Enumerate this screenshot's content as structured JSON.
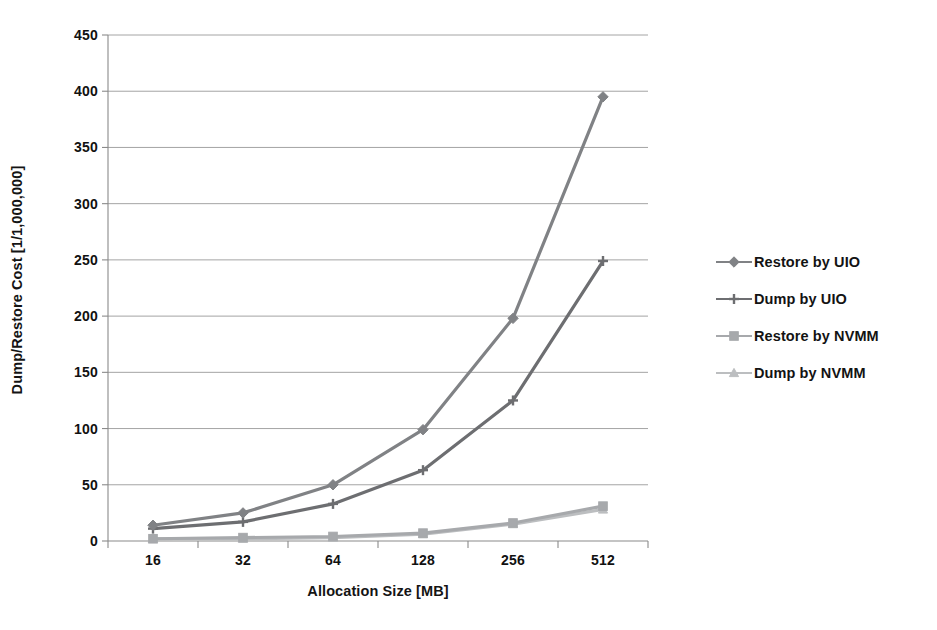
{
  "chart_data": {
    "type": "line",
    "title": "",
    "xlabel": "Allocation Size [MB]",
    "ylabel": "Dump/Restore Cost [1/1,000,000]",
    "categories": [
      "16",
      "32",
      "64",
      "128",
      "256",
      "512"
    ],
    "ylim": [
      0,
      450
    ],
    "ytick_labels": [
      "0",
      "50",
      "100",
      "150",
      "200",
      "250",
      "300",
      "350",
      "400",
      "450"
    ],
    "ytick_values": [
      0,
      50,
      100,
      150,
      200,
      250,
      300,
      350,
      400,
      450
    ],
    "grid": "horizontal",
    "legend_position": "right",
    "series": [
      {
        "name": "Restore by UIO",
        "values": [
          14,
          25,
          50,
          99,
          198,
          395
        ],
        "color": "#808285",
        "marker": "diamond"
      },
      {
        "name": "Dump by UIO",
        "values": [
          11,
          17,
          33,
          63,
          125,
          249
        ],
        "color": "#6d6e71",
        "marker": "plus"
      },
      {
        "name": "Restore by NVMM",
        "values": [
          2,
          3,
          4,
          7,
          16,
          31
        ],
        "color": "#a7a9ac",
        "marker": "square"
      },
      {
        "name": "Dump by NVMM",
        "values": [
          2,
          2,
          3,
          6,
          15,
          28
        ],
        "color": "#bcbec0",
        "marker": "triangle"
      }
    ]
  },
  "axes": {
    "y_title": "Dump/Restore Cost [1/1,000,000]",
    "x_title": "Allocation Size [MB]"
  },
  "legend": {
    "items": [
      {
        "label": "Restore by UIO"
      },
      {
        "label": "Dump by UIO"
      },
      {
        "label": "Restore by NVMM"
      },
      {
        "label": "Dump by NVMM"
      }
    ]
  }
}
